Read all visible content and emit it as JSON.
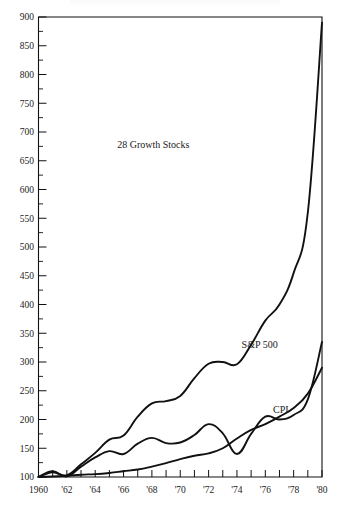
{
  "figure": {
    "caption_fragment": "",
    "background_color": "#ffffff",
    "ink_color": "#111111"
  },
  "chart_data": {
    "type": "line",
    "title": "",
    "subtitle": "",
    "xlabel": "",
    "ylabel": "",
    "xlim": [
      1960,
      1980
    ],
    "ylim": [
      100,
      900
    ],
    "yticks": [
      100,
      150,
      200,
      250,
      300,
      350,
      400,
      450,
      500,
      550,
      600,
      650,
      700,
      750,
      800,
      850,
      900
    ],
    "ytick_labels": [
      "100",
      "150",
      "200",
      "250",
      "300",
      "350",
      "400",
      "450",
      "500",
      "550",
      "600",
      "650",
      "700",
      "750",
      "800",
      "850",
      "900"
    ],
    "yminor_ticks": [
      125,
      175,
      225,
      275,
      325,
      375,
      425,
      475,
      525,
      575,
      625,
      675,
      725,
      775,
      825,
      875
    ],
    "xticks": [
      1960,
      1961,
      1962,
      1963,
      1964,
      1965,
      1966,
      1967,
      1968,
      1969,
      1970,
      1971,
      1972,
      1973,
      1974,
      1975,
      1976,
      1977,
      1978,
      1979,
      1980
    ],
    "xtick_labels": [
      "1960",
      "",
      "'62",
      "",
      "'64",
      "",
      "'66",
      "",
      "'68",
      "",
      "'70",
      "",
      "'72",
      "",
      "'74",
      "",
      "'76",
      "",
      "'78",
      "",
      "'80"
    ],
    "grid": false,
    "legend_position": "inline-annotations",
    "index_base": 100,
    "x": [
      1960,
      1961,
      1962,
      1963,
      1964,
      1965,
      1966,
      1967,
      1968,
      1969,
      1970,
      1971,
      1972,
      1973,
      1974,
      1975,
      1976,
      1977,
      1978,
      1979,
      1980
    ],
    "series": [
      {
        "name": "28 Growth Stocks",
        "label": "28 Growth Stocks",
        "label_x": 1968.1,
        "label_y": 672,
        "values": [
          100,
          108,
          103,
          122,
          142,
          165,
          172,
          205,
          228,
          232,
          241,
          272,
          297,
          300,
          296,
          330,
          372,
          400,
          455,
          560,
          890
        ]
      },
      {
        "name": "S&P 500",
        "label": "S&P 500",
        "label_x": 1975.6,
        "label_y": 325,
        "values": [
          100,
          110,
          101,
          118,
          134,
          145,
          140,
          158,
          168,
          159,
          160,
          173,
          192,
          176,
          140,
          175,
          205,
          200,
          208,
          235,
          335
        ]
      },
      {
        "name": "CPI",
        "label": "CPI",
        "label_x": 1977.1,
        "label_y": 212,
        "values": [
          100,
          101,
          102,
          104,
          105,
          107,
          110,
          113,
          118,
          124,
          131,
          137,
          141,
          150,
          167,
          182,
          192,
          205,
          220,
          245,
          290
        ]
      }
    ]
  }
}
